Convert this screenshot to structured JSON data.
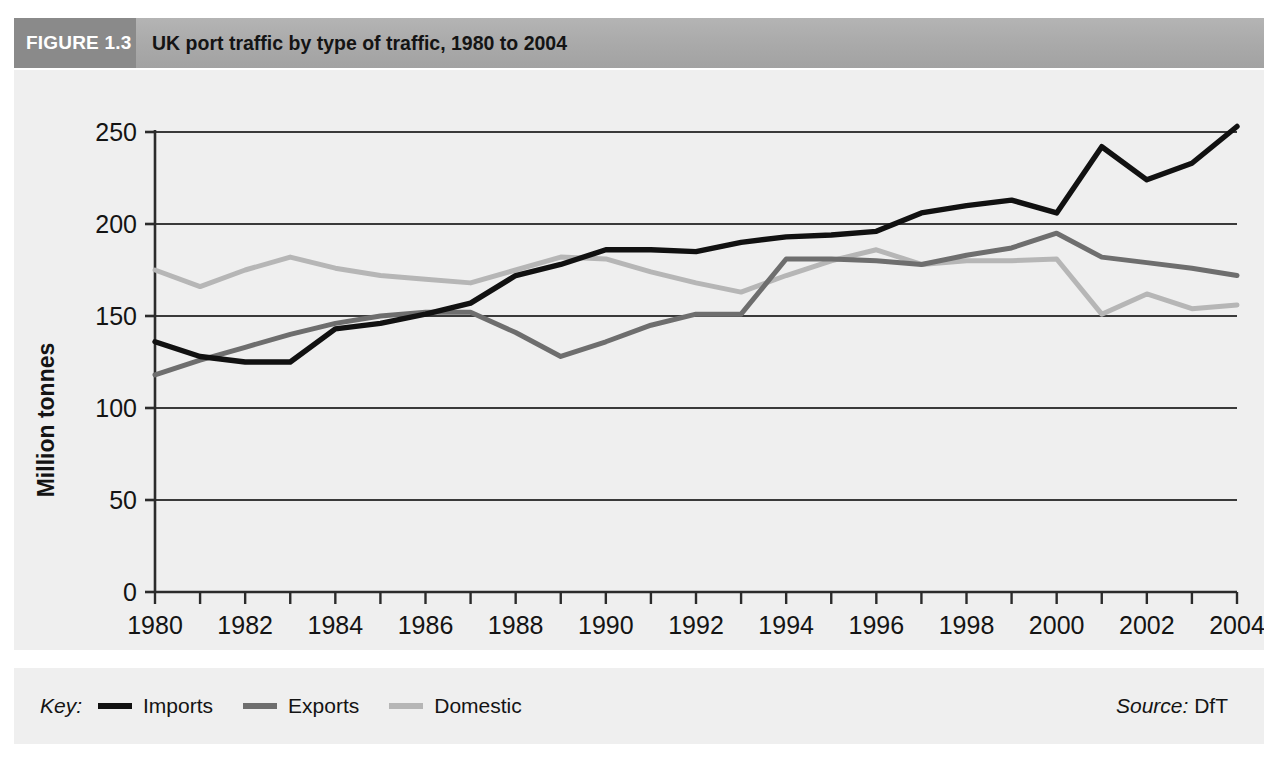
{
  "figure": {
    "tag": "FIGURE 1.3",
    "title": "UK port traffic by type of traffic, 1980 to 2004"
  },
  "key": {
    "label": "Key:",
    "entries": [
      {
        "name": "Imports",
        "color": "#111111"
      },
      {
        "name": "Exports",
        "color": "#6e6e6e"
      },
      {
        "name": "Domestic",
        "color": "#b6b6b6"
      }
    ]
  },
  "source": {
    "prefix": "Source:",
    "value": "DfT"
  },
  "colors": {
    "header_band": "#aaaaaa",
    "figure_tag": "#8a8a8a",
    "panel": "#efefef",
    "axis": "#2b2b2b",
    "gridline": "#3a3a3a",
    "imports": "#111111",
    "exports": "#6e6e6e",
    "domestic": "#b6b6b6"
  },
  "chart_data": {
    "type": "line",
    "title": "UK port traffic by type of traffic, 1980 to 2004",
    "xlabel": "",
    "ylabel": "Million tonnes",
    "xlim": [
      1980,
      2004
    ],
    "ylim": [
      0,
      250
    ],
    "yticks": [
      0,
      50,
      100,
      150,
      200,
      250
    ],
    "ytick_labels": [
      "0",
      "50",
      "100",
      "150",
      "200",
      "250"
    ],
    "xticks": [
      1980,
      1981,
      1982,
      1983,
      1984,
      1985,
      1986,
      1987,
      1988,
      1989,
      1990,
      1991,
      1992,
      1993,
      1994,
      1995,
      1996,
      1997,
      1998,
      1999,
      2000,
      2001,
      2002,
      2003,
      2004
    ],
    "xtick_labels": [
      "1980",
      "",
      "1982",
      "",
      "1984",
      "",
      "1986",
      "",
      "1988",
      "",
      "1990",
      "",
      "1992",
      "",
      "1994",
      "",
      "1996",
      "",
      "1998",
      "",
      "2000",
      "",
      "2002",
      "",
      "2004"
    ],
    "grid": "horizontal",
    "legend_position": "bottom-left",
    "x": [
      1980,
      1981,
      1982,
      1983,
      1984,
      1985,
      1986,
      1987,
      1988,
      1989,
      1990,
      1991,
      1992,
      1993,
      1994,
      1995,
      1996,
      1997,
      1998,
      1999,
      2000,
      2001,
      2002,
      2003,
      2004
    ],
    "series": [
      {
        "name": "Imports",
        "color": "#111111",
        "values": [
          136,
          128,
          125,
          125,
          143,
          146,
          151,
          157,
          172,
          178,
          186,
          186,
          185,
          190,
          193,
          194,
          196,
          206,
          210,
          213,
          206,
          242,
          224,
          233,
          253
        ]
      },
      {
        "name": "Exports",
        "color": "#6e6e6e",
        "values": [
          118,
          126,
          133,
          140,
          146,
          150,
          152,
          152,
          141,
          128,
          136,
          145,
          151,
          151,
          181,
          181,
          180,
          178,
          183,
          187,
          195,
          182,
          179,
          176,
          172
        ]
      },
      {
        "name": "Domestic",
        "color": "#b6b6b6",
        "values": [
          175,
          166,
          175,
          182,
          176,
          172,
          170,
          168,
          175,
          182,
          181,
          174,
          168,
          163,
          172,
          180,
          186,
          178,
          180,
          180,
          181,
          151,
          162,
          154,
          156
        ]
      }
    ]
  }
}
